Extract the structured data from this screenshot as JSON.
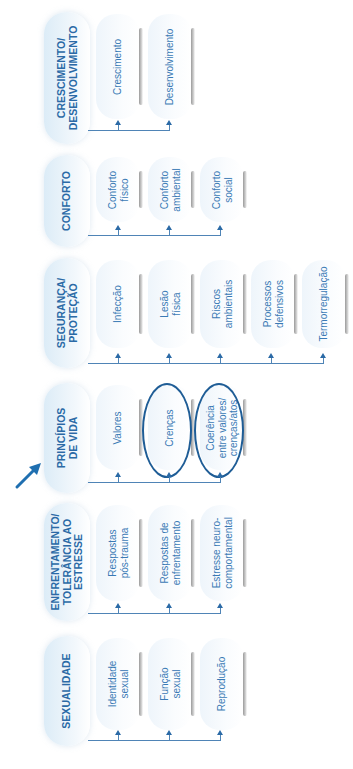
{
  "diagram": {
    "orientation": "rotated-90-ccw",
    "accent_color": "#2b6aa6",
    "highlight_color": "#1f5d96",
    "focus_arrow": {
      "points_to": "principios"
    },
    "domains": [
      {
        "id": "crescimento",
        "label": "CRESCIMENTO/\nDESENVOLVIMENTO",
        "classes": [
          {
            "label": "Crescimento"
          },
          {
            "label": "Desenvolvimento"
          }
        ]
      },
      {
        "id": "conforto",
        "label": "CONFORTO",
        "classes": [
          {
            "label": "Conforto\nfísico"
          },
          {
            "label": "Conforto\nambiental"
          },
          {
            "label": "Conforto\nsocial"
          }
        ]
      },
      {
        "id": "seguranca",
        "label": "SEGURANÇA/\nPROTEÇÃO",
        "classes": [
          {
            "label": "Infecção"
          },
          {
            "label": "Lesão\nfísica"
          },
          {
            "label": "Riscos\nambientais"
          },
          {
            "label": "Processos\ndefensivos"
          },
          {
            "label": "Termorregulação"
          }
        ]
      },
      {
        "id": "principios",
        "label": "PRINCÍPIOS\nDE VIDA",
        "classes": [
          {
            "label": "Valores",
            "circled": false
          },
          {
            "label": "Crenças",
            "circled": true
          },
          {
            "label": "Coerência\nentre valores/\ncrenças/atos",
            "circled": true
          }
        ]
      },
      {
        "id": "enfrentamento",
        "label": "ENFRENTAMENTO/\nTOLERÂNCIA AO\nESTRESSE",
        "classes": [
          {
            "label": "Respostas\npós-trauma"
          },
          {
            "label": "Respostas de\nenfrentamento"
          },
          {
            "label": "Estresse neuro-\ncomportamental"
          }
        ]
      },
      {
        "id": "sexualidade",
        "label": "SEXUALIDADE",
        "classes": [
          {
            "label": "Identidade\nsexual"
          },
          {
            "label": "Função\nsexual"
          },
          {
            "label": "Reprodução"
          }
        ]
      }
    ]
  }
}
